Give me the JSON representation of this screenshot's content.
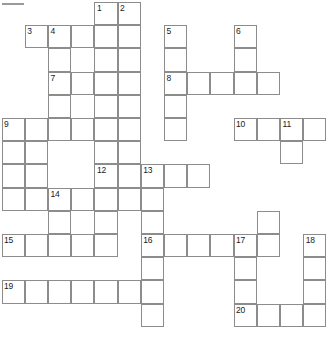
{
  "puzzle": {
    "title": "Crossword Grid",
    "columns": 14,
    "rows": 14,
    "cell_size": 23.2,
    "origin_x": 1.6,
    "origin_y": 2.0,
    "grid_line_color": "#8c8c8c",
    "cell_fill_color": "#ffffff",
    "number_color": "#1a1a1a",
    "top_rule_color": "#9a9a9a",
    "clue_numbers": [
      1,
      2,
      3,
      4,
      5,
      6,
      7,
      8,
      9,
      10,
      11,
      12,
      13,
      14,
      15,
      16,
      17,
      18,
      19,
      20
    ],
    "cells": [
      {
        "col": 4,
        "row": 0,
        "number": "1"
      },
      {
        "col": 5,
        "row": 0,
        "number": "2"
      },
      {
        "col": 1,
        "row": 1,
        "number": "3"
      },
      {
        "col": 2,
        "row": 1,
        "number": "4"
      },
      {
        "col": 3,
        "row": 1,
        "number": ""
      },
      {
        "col": 4,
        "row": 1,
        "number": ""
      },
      {
        "col": 5,
        "row": 1,
        "number": ""
      },
      {
        "col": 7,
        "row": 1,
        "number": "5"
      },
      {
        "col": 10,
        "row": 1,
        "number": "6"
      },
      {
        "col": 2,
        "row": 2,
        "number": ""
      },
      {
        "col": 4,
        "row": 2,
        "number": ""
      },
      {
        "col": 5,
        "row": 2,
        "number": ""
      },
      {
        "col": 7,
        "row": 2,
        "number": ""
      },
      {
        "col": 10,
        "row": 2,
        "number": ""
      },
      {
        "col": 2,
        "row": 3,
        "number": "7"
      },
      {
        "col": 3,
        "row": 3,
        "number": ""
      },
      {
        "col": 4,
        "row": 3,
        "number": ""
      },
      {
        "col": 5,
        "row": 3,
        "number": ""
      },
      {
        "col": 7,
        "row": 3,
        "number": "8"
      },
      {
        "col": 8,
        "row": 3,
        "number": ""
      },
      {
        "col": 9,
        "row": 3,
        "number": ""
      },
      {
        "col": 10,
        "row": 3,
        "number": ""
      },
      {
        "col": 11,
        "row": 3,
        "number": ""
      },
      {
        "col": 2,
        "row": 4,
        "number": ""
      },
      {
        "col": 4,
        "row": 4,
        "number": ""
      },
      {
        "col": 5,
        "row": 4,
        "number": ""
      },
      {
        "col": 7,
        "row": 4,
        "number": ""
      },
      {
        "col": 0,
        "row": 5,
        "number": "9"
      },
      {
        "col": 1,
        "row": 5,
        "number": ""
      },
      {
        "col": 2,
        "row": 5,
        "number": ""
      },
      {
        "col": 3,
        "row": 5,
        "number": ""
      },
      {
        "col": 4,
        "row": 5,
        "number": ""
      },
      {
        "col": 5,
        "row": 5,
        "number": ""
      },
      {
        "col": 7,
        "row": 5,
        "number": ""
      },
      {
        "col": 10,
        "row": 5,
        "number": "10"
      },
      {
        "col": 11,
        "row": 5,
        "number": ""
      },
      {
        "col": 12,
        "row": 5,
        "number": "11"
      },
      {
        "col": 13,
        "row": 5,
        "number": ""
      },
      {
        "col": 0,
        "row": 6,
        "number": ""
      },
      {
        "col": 1,
        "row": 6,
        "number": ""
      },
      {
        "col": 4,
        "row": 6,
        "number": ""
      },
      {
        "col": 5,
        "row": 6,
        "number": ""
      },
      {
        "col": 12,
        "row": 6,
        "number": ""
      },
      {
        "col": 0,
        "row": 7,
        "number": ""
      },
      {
        "col": 1,
        "row": 7,
        "number": ""
      },
      {
        "col": 4,
        "row": 7,
        "number": "12"
      },
      {
        "col": 5,
        "row": 7,
        "number": ""
      },
      {
        "col": 6,
        "row": 7,
        "number": "13"
      },
      {
        "col": 7,
        "row": 7,
        "number": ""
      },
      {
        "col": 8,
        "row": 7,
        "number": ""
      },
      {
        "col": 0,
        "row": 8,
        "number": ""
      },
      {
        "col": 1,
        "row": 8,
        "number": ""
      },
      {
        "col": 2,
        "row": 8,
        "number": "14"
      },
      {
        "col": 3,
        "row": 8,
        "number": ""
      },
      {
        "col": 4,
        "row": 8,
        "number": ""
      },
      {
        "col": 5,
        "row": 8,
        "number": ""
      },
      {
        "col": 6,
        "row": 8,
        "number": ""
      },
      {
        "col": 2,
        "row": 9,
        "number": ""
      },
      {
        "col": 4,
        "row": 9,
        "number": ""
      },
      {
        "col": 6,
        "row": 9,
        "number": ""
      },
      {
        "col": 11,
        "row": 9,
        "number": ""
      },
      {
        "col": 0,
        "row": 10,
        "number": "15"
      },
      {
        "col": 1,
        "row": 10,
        "number": ""
      },
      {
        "col": 2,
        "row": 10,
        "number": ""
      },
      {
        "col": 3,
        "row": 10,
        "number": ""
      },
      {
        "col": 4,
        "row": 10,
        "number": ""
      },
      {
        "col": 6,
        "row": 10,
        "number": "16"
      },
      {
        "col": 7,
        "row": 10,
        "number": ""
      },
      {
        "col": 8,
        "row": 10,
        "number": ""
      },
      {
        "col": 9,
        "row": 10,
        "number": ""
      },
      {
        "col": 10,
        "row": 10,
        "number": "17"
      },
      {
        "col": 11,
        "row": 10,
        "number": ""
      },
      {
        "col": 13,
        "row": 10,
        "number": "18"
      },
      {
        "col": 6,
        "row": 11,
        "number": ""
      },
      {
        "col": 10,
        "row": 11,
        "number": ""
      },
      {
        "col": 13,
        "row": 11,
        "number": ""
      },
      {
        "col": 0,
        "row": 12,
        "number": "19"
      },
      {
        "col": 1,
        "row": 12,
        "number": ""
      },
      {
        "col": 2,
        "row": 12,
        "number": ""
      },
      {
        "col": 3,
        "row": 12,
        "number": ""
      },
      {
        "col": 4,
        "row": 12,
        "number": ""
      },
      {
        "col": 5,
        "row": 12,
        "number": ""
      },
      {
        "col": 6,
        "row": 12,
        "number": ""
      },
      {
        "col": 10,
        "row": 12,
        "number": ""
      },
      {
        "col": 13,
        "row": 12,
        "number": ""
      },
      {
        "col": 6,
        "row": 13,
        "number": ""
      },
      {
        "col": 10,
        "row": 13,
        "number": "20"
      },
      {
        "col": 11,
        "row": 13,
        "number": ""
      },
      {
        "col": 12,
        "row": 13,
        "number": ""
      },
      {
        "col": 13,
        "row": 13,
        "number": ""
      }
    ]
  }
}
